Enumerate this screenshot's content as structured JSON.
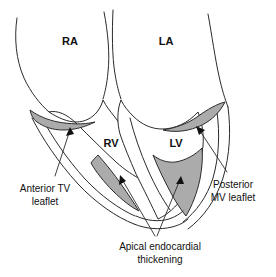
{
  "figure": {
    "kind": "anatomical-line-diagram",
    "background_color": "#ffffff",
    "outline_color": "#2b2b2b",
    "thickening_fill_color": "#ababab",
    "text_color": "#111111"
  },
  "chamber_labels": [
    {
      "id": "ra",
      "text": "RA",
      "x": 70,
      "y": 42
    },
    {
      "id": "la",
      "text": "LA",
      "x": 166,
      "y": 42
    },
    {
      "id": "rv",
      "text": "RV",
      "x": 111,
      "y": 144
    },
    {
      "id": "lv",
      "text": "LV",
      "x": 176,
      "y": 144
    }
  ],
  "annotations": [
    {
      "id": "anterior-tv-leaflet",
      "lines": [
        "Anterior TV",
        "leaflet"
      ],
      "x": 45,
      "y": 192,
      "line_height": 13
    },
    {
      "id": "posterior-mv-leaflet",
      "lines": [
        "Posterior",
        "MV leaflet"
      ],
      "x": 233,
      "y": 188,
      "line_height": 13
    },
    {
      "id": "apical-endocardial-thickening",
      "lines": [
        "Apical endocardial",
        "thickening"
      ],
      "x": 160,
      "y": 250,
      "line_height": 13
    }
  ]
}
